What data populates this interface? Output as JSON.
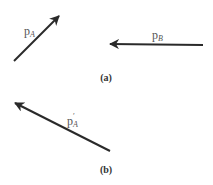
{
  "figure": {
    "panel_a": {
      "caption": "(a)",
      "vectors": [
        {
          "id": "pA",
          "label_base": "p",
          "label_sub": "A",
          "from": [
            14,
            61
          ],
          "to": [
            59,
            16
          ],
          "label_pos": [
            24,
            25
          ]
        },
        {
          "id": "pB",
          "label_base": "p",
          "label_sub": "B",
          "from": [
            203,
            45
          ],
          "to": [
            110,
            44
          ],
          "label_pos": [
            152,
            29
          ]
        }
      ]
    },
    "panel_b": {
      "caption": "(b)",
      "vectors": [
        {
          "id": "pA_prime",
          "label_base": "p",
          "label_sub": "A",
          "label_prime": "′",
          "from": [
            110,
            151
          ],
          "to": [
            15,
            103
          ],
          "label_pos": [
            67,
            115
          ]
        }
      ]
    },
    "colors": {
      "arrow": "#2a2a2a",
      "label": "#555555",
      "caption": "#333333"
    }
  }
}
